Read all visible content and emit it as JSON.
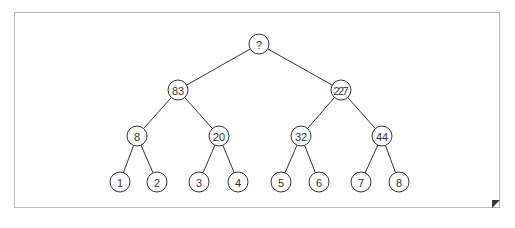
{
  "diagram": {
    "type": "binary-tree",
    "nodes": [
      {
        "id": "root",
        "label": "?",
        "x": 259,
        "y": 44
      },
      {
        "id": "n1",
        "label": "83",
        "x": 178,
        "y": 90
      },
      {
        "id": "n2",
        "label": "227",
        "x": 341,
        "y": 90
      },
      {
        "id": "n3",
        "label": "8",
        "x": 137,
        "y": 136
      },
      {
        "id": "n4",
        "label": "20",
        "x": 219,
        "y": 136
      },
      {
        "id": "n5",
        "label": "32",
        "x": 301,
        "y": 136
      },
      {
        "id": "n6",
        "label": "44",
        "x": 382,
        "y": 136
      },
      {
        "id": "l1",
        "label": "1",
        "x": 120,
        "y": 182
      },
      {
        "id": "l2",
        "label": "2",
        "x": 157,
        "y": 182
      },
      {
        "id": "l3",
        "label": "3",
        "x": 199,
        "y": 182
      },
      {
        "id": "l4",
        "label": "4",
        "x": 238,
        "y": 182
      },
      {
        "id": "l5",
        "label": "5",
        "x": 281,
        "y": 182
      },
      {
        "id": "l6",
        "label": "6",
        "x": 319,
        "y": 182
      },
      {
        "id": "l7",
        "label": "7",
        "x": 361,
        "y": 182
      },
      {
        "id": "l8",
        "label": "8",
        "x": 399,
        "y": 182
      }
    ],
    "edges": [
      [
        "root",
        "n1"
      ],
      [
        "root",
        "n2"
      ],
      [
        "n1",
        "n3"
      ],
      [
        "n1",
        "n4"
      ],
      [
        "n2",
        "n5"
      ],
      [
        "n2",
        "n6"
      ],
      [
        "n3",
        "l1"
      ],
      [
        "n3",
        "l2"
      ],
      [
        "n4",
        "l3"
      ],
      [
        "n4",
        "l4"
      ],
      [
        "n5",
        "l5"
      ],
      [
        "n5",
        "l6"
      ],
      [
        "n6",
        "l7"
      ],
      [
        "n6",
        "l8"
      ]
    ],
    "node_radius": 10
  }
}
